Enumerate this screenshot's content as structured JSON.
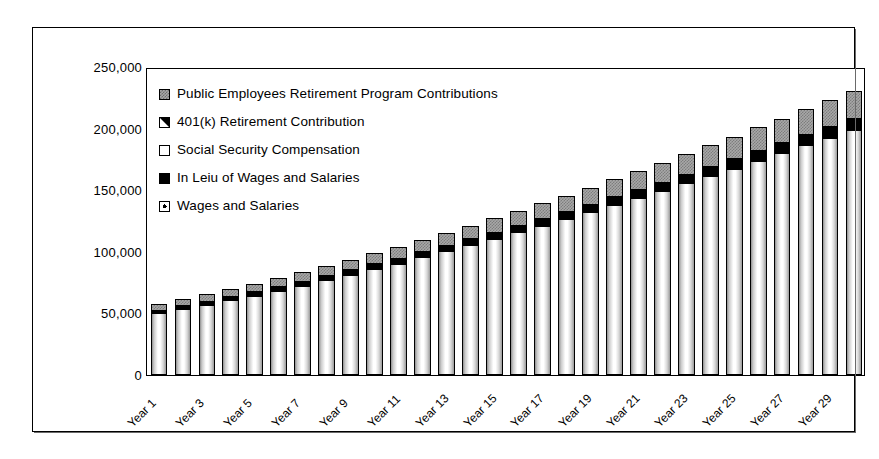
{
  "chart_data": {
    "type": "bar",
    "title": "",
    "subtitle": "",
    "xlabel": "",
    "ylabel": "",
    "ylim": [
      0,
      250000
    ],
    "ytick_labels": [
      "250,000",
      "200,000",
      "150,000",
      "100,000",
      "50,000",
      "0"
    ],
    "ytick_values": [
      250000,
      200000,
      150000,
      100000,
      50000,
      0
    ],
    "grid": false,
    "stacked": true,
    "legend_position": "inside-top-left",
    "categories": [
      "Year 1",
      "Year 2",
      "Year 3",
      "Year 4",
      "Year 5",
      "Year 6",
      "Year 7",
      "Year 8",
      "Year 9",
      "Year 10",
      "Year 11",
      "Year 12",
      "Year 13",
      "Year 14",
      "Year 15",
      "Year 16",
      "Year 17",
      "Year 18",
      "Year 19",
      "Year 20",
      "Year 21",
      "Year 22",
      "Year 23",
      "Year 24",
      "Year 25",
      "Year 26",
      "Year 27",
      "Year 28",
      "Year 29",
      "Year 30"
    ],
    "xtick_labels": [
      "Year 1",
      "Year 3",
      "Year 5",
      "Year 7",
      "Year 9",
      "Year 11",
      "Year 13",
      "Year 15",
      "Year 17",
      "Year 19",
      "Year 21",
      "Year 23",
      "Year 25",
      "Year 27",
      "Year 29"
    ],
    "series": [
      {
        "name": "Wages and Salaries",
        "key": "wages",
        "color": "#ffffff",
        "pattern": "vertical-gradient",
        "values": [
          50000,
          53500,
          57000,
          61000,
          64500,
          68500,
          72500,
          77000,
          81500,
          86000,
          90500,
          95500,
          100500,
          105500,
          110500,
          116000,
          121000,
          126500,
          132000,
          138000,
          143500,
          149500,
          155500,
          161500,
          167500,
          174000,
          180000,
          186500,
          192500,
          199000
        ]
      },
      {
        "name": "In Lieu of Wages and Salaries",
        "key": "in_lieu",
        "color": "#000000",
        "pattern": "solid-black",
        "values": [
          2200,
          2400,
          2550,
          2700,
          2850,
          3050,
          3200,
          3400,
          3600,
          3800,
          4000,
          4200,
          4450,
          4650,
          4900,
          5100,
          5350,
          5600,
          5850,
          6100,
          6350,
          6600,
          6900,
          7150,
          7450,
          7700,
          8000,
          8300,
          8550,
          8850
        ]
      },
      {
        "name": "Social Security Compensation",
        "key": "social_security",
        "color": "#ffffff",
        "pattern": "white",
        "values": [
          0,
          0,
          0,
          0,
          0,
          0,
          0,
          0,
          0,
          0,
          0,
          0,
          0,
          0,
          0,
          0,
          0,
          0,
          0,
          0,
          0,
          0,
          0,
          0,
          0,
          0,
          0,
          0,
          0,
          0
        ]
      },
      {
        "name": "401(k) Retirement Contribution",
        "key": "retirement_401k",
        "color": "#ffffff",
        "pattern": "diagonal-black",
        "values": [
          0,
          0,
          0,
          0,
          0,
          0,
          0,
          0,
          0,
          0,
          0,
          0,
          0,
          0,
          0,
          0,
          0,
          0,
          0,
          0,
          0,
          0,
          0,
          0,
          0,
          0,
          0,
          0,
          0,
          0
        ]
      },
      {
        "name": "Public Employees Retirement Program Contributions",
        "key": "pers",
        "color": "#a8a8a8",
        "pattern": "gray-checker",
        "values": [
          5300,
          5600,
          6000,
          6300,
          6800,
          7200,
          7600,
          8100,
          8600,
          9100,
          9600,
          10100,
          10700,
          11200,
          11800,
          12400,
          13000,
          13600,
          14200,
          14900,
          15600,
          16300,
          17000,
          17700,
          18500,
          19300,
          20100,
          21000,
          21800,
          22700
        ]
      }
    ],
    "totals": [
      57500,
      61500,
      65550,
      70000,
      74150,
      78750,
      83300,
      88500,
      93700,
      98900,
      104100,
      109800,
      115650,
      121350,
      127200,
      133500,
      139350,
      145700,
      152050,
      159000,
      165450,
      172400,
      179400,
      186350,
      193450,
      201000,
      208100,
      215800,
      222850,
      230550
    ]
  },
  "legend": {
    "items": [
      {
        "label": "Public Employees Retirement Program Contributions",
        "key_class": "key-pers",
        "name": "pers"
      },
      {
        "label": "401(k) Retirement Contribution",
        "key_class": "key-401k",
        "name": "retirement-401k"
      },
      {
        "label": "Social Security Compensation",
        "key_class": "key-ss",
        "name": "social-security"
      },
      {
        "label": "In Leiu of Wages and Salaries",
        "key_class": "key-inlieu",
        "name": "in-lieu"
      },
      {
        "label": "Wages and Salaries",
        "key_class": "key-wages",
        "name": "wages"
      }
    ]
  },
  "colors": {
    "frame": "#000000",
    "pers_fill": "#a8a8a8",
    "in_lieu_fill": "#000000",
    "wages_fill": "#ffffff",
    "background": "#ffffff"
  }
}
